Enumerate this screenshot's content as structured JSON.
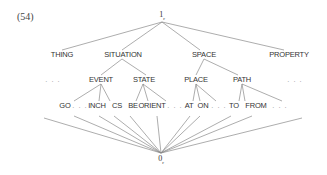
{
  "example_number": "(54)",
  "top_node": {
    "base": "1",
    "sub": "r"
  },
  "bottom_node": {
    "base": "0",
    "sub": "r"
  },
  "level1": [
    "THING",
    "SITUATION",
    "SPACE",
    "PROPERTY"
  ],
  "level2": {
    "left_ellipsis": ". . .",
    "event": "EVENT",
    "state": "STATE",
    "place": "PLACE",
    "path": "PATH",
    "right_ellipsis": ". . ."
  },
  "level3": {
    "go": "GO",
    "e1": ". . .",
    "inch": "INCH",
    "cs": "CS",
    "be": "BE",
    "orient": "ORIENT",
    "e2": ". . .",
    "at": "AT",
    "on": "ON",
    "e3": ". . .",
    "to": "TO",
    "from": "FROM",
    "e4": ". . ."
  }
}
